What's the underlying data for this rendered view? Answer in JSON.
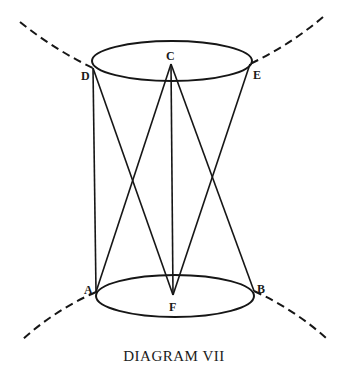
{
  "diagram": {
    "caption": "DIAGRAM VII",
    "points": {
      "C": "C",
      "D": "D",
      "E": "E",
      "A": "A",
      "B": "B",
      "F": "F"
    },
    "elements": [
      "upper ellipse through D and E with center C",
      "lower ellipse through A and B with center F",
      "lines D-A and E-B forming cone sides",
      "lines C-A, C-B and F-D? (crossing lines from C to A and B; F to D and E)",
      "vertical line C-F",
      "dashed curves extending outward from D, E, A, B"
    ],
    "colors": {
      "ink": "#161616",
      "background": "#ffffff"
    }
  }
}
